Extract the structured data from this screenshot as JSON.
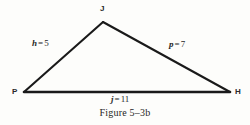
{
  "figure": {
    "caption": "Figure 5–3b",
    "background_color": "#fdfdfb",
    "stroke_color": "#1a1a1a",
    "text_color": "#262626"
  },
  "triangle": {
    "vertices": [
      {
        "name": "J",
        "label": "J",
        "x": 103,
        "y": 22
      },
      {
        "name": "P",
        "label": "P",
        "x": 24,
        "y": 92
      },
      {
        "name": "H",
        "label": "H",
        "x": 230,
        "y": 92
      }
    ],
    "sides": [
      {
        "name": "side-h",
        "between": "P-J",
        "variable": "h",
        "equals": "=",
        "value": "5",
        "text": "h = 5"
      },
      {
        "name": "side-p",
        "between": "J-H",
        "variable": "p",
        "equals": "=",
        "value": "7",
        "text": "p = 7"
      },
      {
        "name": "side-j",
        "between": "P-H",
        "variable": "j",
        "equals": "=",
        "value": "11",
        "text": "j = 11"
      }
    ]
  }
}
